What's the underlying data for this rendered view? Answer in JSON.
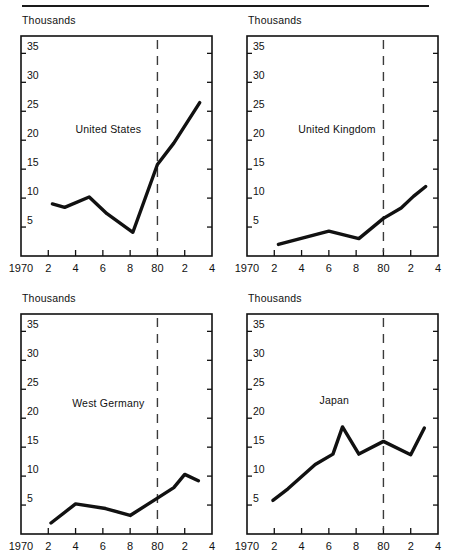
{
  "figure": {
    "has_top_rule": true,
    "unit_label": "Thousands",
    "line_color": "#111111",
    "divider_color": "#3b3b3b",
    "background": "#ffffff"
  },
  "axis": {
    "x_tick_values": [
      1970,
      1972,
      1974,
      1976,
      1978,
      1980,
      1982,
      1984
    ],
    "x_tick_labels": [
      "1970",
      "2",
      "4",
      "6",
      "8",
      "80",
      "2",
      "4"
    ],
    "y_tick_values": [
      5,
      10,
      15,
      20,
      25,
      30,
      35
    ],
    "y_tick_labels": [
      "5",
      "10",
      "15",
      "20",
      "25",
      "30",
      "35"
    ],
    "xlim": [
      1970,
      1984
    ],
    "ylim": [
      0,
      38
    ],
    "divider_x": 1980
  },
  "chart_data": [
    {
      "type": "line",
      "title": "United States",
      "xlabel": "",
      "ylabel": "Thousands",
      "xlim": [
        1970,
        1984
      ],
      "ylim": [
        0,
        38
      ],
      "grid": false,
      "legend_position": "none",
      "annotations": [
        "dashed vertical reference line at 1980"
      ],
      "x": [
        1972.3,
        1973.2,
        1975,
        1976.3,
        1978.2,
        1980,
        1981.2,
        1983.1
      ],
      "values": [
        9.0,
        8.4,
        10.2,
        7.3,
        4.1,
        15.8,
        19.5,
        26.5
      ],
      "categories": [
        "1972",
        "1973",
        "1975",
        "1976",
        "1978",
        "1980",
        "1981",
        "1983"
      ]
    },
    {
      "type": "line",
      "title": "United Kingdom",
      "xlabel": "",
      "ylabel": "Thousands",
      "xlim": [
        1970,
        1984
      ],
      "ylim": [
        0,
        38
      ],
      "grid": false,
      "legend_position": "none",
      "annotations": [
        "dashed vertical reference line at 1980"
      ],
      "x": [
        1972.3,
        1976,
        1978.2,
        1980,
        1981.3,
        1982.2,
        1983.1
      ],
      "values": [
        2.0,
        4.3,
        3.0,
        6.5,
        8.3,
        10.3,
        12.0
      ],
      "categories": [
        "1972",
        "1976",
        "1978",
        "1980",
        "1981",
        "1982",
        "1983"
      ]
    },
    {
      "type": "line",
      "title": "West Germany",
      "xlabel": "",
      "ylabel": "Thousands",
      "xlim": [
        1970,
        1984
      ],
      "ylim": [
        0,
        38
      ],
      "grid": false,
      "legend_position": "none",
      "annotations": [
        "dashed vertical reference line at 1980"
      ],
      "x": [
        1972.2,
        1974,
        1976.2,
        1978,
        1980,
        1981.2,
        1982,
        1983
      ],
      "values": [
        1.9,
        5.2,
        4.4,
        3.2,
        6.2,
        8.0,
        10.3,
        9.2
      ],
      "categories": [
        "1972",
        "1974",
        "1976",
        "1978",
        "1980",
        "1981",
        "1982",
        "1983"
      ]
    },
    {
      "type": "line",
      "title": "Japan",
      "xlabel": "",
      "ylabel": "Thousands",
      "xlim": [
        1970,
        1984
      ],
      "ylim": [
        0,
        38
      ],
      "grid": false,
      "legend_position": "none",
      "annotations": [
        "dashed vertical reference line at 1980"
      ],
      "x": [
        1971.9,
        1973,
        1975,
        1976.3,
        1977,
        1978.2,
        1980,
        1982,
        1983
      ],
      "values": [
        5.8,
        7.8,
        12.0,
        13.8,
        18.5,
        13.8,
        16.0,
        13.7,
        18.3
      ],
      "categories": [
        "1972",
        "1973",
        "1975",
        "1976",
        "1977",
        "1978",
        "1980",
        "1982",
        "1983"
      ]
    }
  ],
  "panels": [
    {
      "id": "us",
      "unit_label": "Thousands",
      "series_label": "United States",
      "label_x": 1976.4,
      "label_y": 21.2
    },
    {
      "id": "uk",
      "unit_label": "Thousands",
      "series_label": "United Kingdom",
      "label_x": 1976.6,
      "label_y": 21.2
    },
    {
      "id": "de",
      "unit_label": "Thousands",
      "series_label": "West Germany",
      "label_x": 1976.4,
      "label_y": 22.0
    },
    {
      "id": "jp",
      "unit_label": "Thousands",
      "series_label": "Japan",
      "label_x": 1976.4,
      "label_y": 22.5
    }
  ]
}
